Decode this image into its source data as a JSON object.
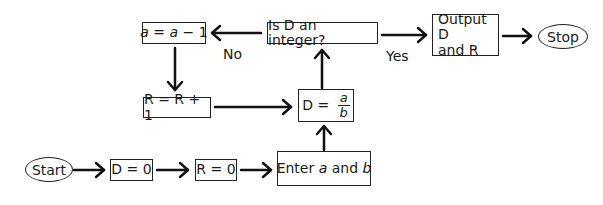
{
  "diagram": {
    "type": "flowchart",
    "nodes": {
      "start": {
        "label": "Start",
        "shape": "ellipse"
      },
      "d_zero": {
        "label": "D = 0",
        "shape": "rectangle"
      },
      "r_zero": {
        "label": "R = 0",
        "shape": "rectangle"
      },
      "enter": {
        "prefix": "Enter ",
        "var_a": "a",
        "mid": " and ",
        "var_b": "b",
        "shape": "rectangle"
      },
      "divide": {
        "lhs": "D = ",
        "numerator": "a",
        "denominator": "b",
        "shape": "rectangle"
      },
      "decision": {
        "label": "Is D an integer?",
        "shape": "rectangle"
      },
      "decrement": {
        "var1": "a",
        "mid": " = ",
        "var2": "a",
        "tail": " − 1",
        "shape": "rectangle"
      },
      "increment": {
        "label": "R = R + 1",
        "shape": "rectangle"
      },
      "output": {
        "line1": "Output D",
        "line2": "and R",
        "shape": "rectangle"
      },
      "stop": {
        "label": "Stop",
        "shape": "ellipse"
      }
    },
    "edge_labels": {
      "no": "No",
      "yes": "Yes"
    },
    "edges": [
      {
        "from": "start",
        "to": "d_zero"
      },
      {
        "from": "d_zero",
        "to": "r_zero"
      },
      {
        "from": "r_zero",
        "to": "enter"
      },
      {
        "from": "enter",
        "to": "divide"
      },
      {
        "from": "divide",
        "to": "decision"
      },
      {
        "from": "decision",
        "to": "decrement",
        "label": "No"
      },
      {
        "from": "decrement",
        "to": "increment"
      },
      {
        "from": "increment",
        "to": "divide"
      },
      {
        "from": "decision",
        "to": "output",
        "label": "Yes"
      },
      {
        "from": "output",
        "to": "stop"
      }
    ]
  }
}
